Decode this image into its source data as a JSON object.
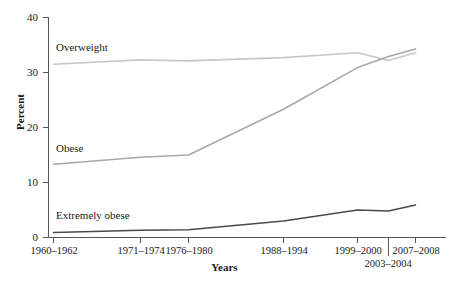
{
  "chart_data": {
    "type": "line",
    "title": "",
    "xlabel": "Years",
    "ylabel": "Percent",
    "ylim": [
      0,
      40
    ],
    "yticks": [
      0,
      10,
      20,
      30,
      40
    ],
    "ytick_labels": [
      "0",
      "10",
      "20",
      "30",
      "40"
    ],
    "grid": false,
    "legend": "inline-series-labels",
    "categories": [
      "1960–1962",
      "1971–1974",
      "1976–1980",
      "1988–1994",
      "1999–2000",
      "2003–2004",
      "2007–2008"
    ],
    "series": [
      {
        "name": "Overweight",
        "color": "#c8c8c8",
        "values": [
          31.5,
          32.3,
          32.1,
          32.7,
          33.6,
          32.2,
          33.6
        ]
      },
      {
        "name": "Obese",
        "color": "#a8a8a8",
        "values": [
          13.3,
          14.6,
          15.0,
          23.3,
          30.9,
          32.9,
          34.3
        ]
      },
      {
        "name": "Extremely obese",
        "color": "#4a4a4a",
        "values": [
          0.9,
          1.3,
          1.4,
          3.0,
          5.0,
          4.8,
          5.9
        ]
      }
    ]
  },
  "axes": {
    "y_title": "Percent",
    "x_title": "Years",
    "y_tick_labels": [
      "40",
      "30",
      "20",
      "10",
      "0"
    ],
    "x_tick_labels": [
      "1960–1962",
      "1971–1974",
      "1976–1980",
      "1988–1994",
      "1999–2000",
      "2003–2004",
      "2007–2008"
    ]
  },
  "series_labels": {
    "overweight": "Overweight",
    "obese": "Obese",
    "extremely_obese": "Extremely obese"
  },
  "colors": {
    "overweight": "#c8c8c8",
    "obese": "#a8a8a8",
    "extremely_obese": "#4a4a4a",
    "axis": "#555555",
    "text": "#1a1a1a"
  }
}
